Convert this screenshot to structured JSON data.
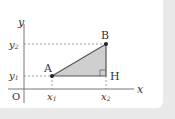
{
  "diagram": {
    "axes": {
      "x_label": "x",
      "y_label": "y",
      "origin_label": "O"
    },
    "points": [
      {
        "name": "A",
        "label": "A"
      },
      {
        "name": "B",
        "label": "B"
      },
      {
        "name": "H",
        "label": "H"
      }
    ],
    "ticks": {
      "x1": {
        "main": "x",
        "sub": "1"
      },
      "x2": {
        "main": "x",
        "sub": "2"
      },
      "y1": {
        "main": "y",
        "sub": "1"
      },
      "y2": {
        "main": "y",
        "sub": "2"
      }
    },
    "colors": {
      "fill": "#c8c8c8",
      "stroke": "#555555",
      "axis": "#666666",
      "background": "#e9e9e9"
    }
  }
}
